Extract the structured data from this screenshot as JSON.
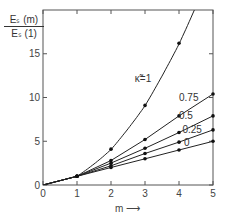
{
  "chart_data": {
    "type": "line",
    "title": "",
    "ylabel_numerator": "Eₛ (m)",
    "ylabel_denominator": "Eₛ (1)",
    "xlabel": "m ⟶",
    "xlim": [
      0,
      5
    ],
    "ylim": [
      0,
      20
    ],
    "xticks": [
      0,
      1,
      2,
      3,
      4,
      5
    ],
    "yticks": [
      0,
      5,
      10,
      15
    ],
    "grid": false,
    "legend_placement": "inline",
    "x": [
      0,
      1,
      2,
      3,
      4,
      5
    ],
    "series": [
      {
        "name": "κ̃=1",
        "values": [
          0,
          1,
          4.1,
          9.1,
          16.2,
          25.0
        ],
        "markers_at": [
          1,
          2,
          3,
          4
        ]
      },
      {
        "name": "0.75",
        "values": [
          0,
          1,
          2.8,
          5.2,
          7.9,
          10.4
        ],
        "markers_at": [
          1,
          2,
          3,
          4,
          5
        ]
      },
      {
        "name": "0.5",
        "values": [
          0,
          1,
          2.5,
          4.2,
          6.0,
          7.9
        ],
        "markers_at": [
          1,
          2,
          3,
          4,
          5
        ]
      },
      {
        "name": "0.25",
        "values": [
          0,
          1,
          2.2,
          3.6,
          4.9,
          6.3
        ],
        "markers_at": [
          1,
          2,
          3,
          4,
          5
        ]
      },
      {
        "name": "0",
        "values": [
          0,
          1,
          2.0,
          3.0,
          4.0,
          5.0
        ],
        "markers_at": [
          1,
          2,
          3,
          4,
          5
        ]
      }
    ]
  }
}
